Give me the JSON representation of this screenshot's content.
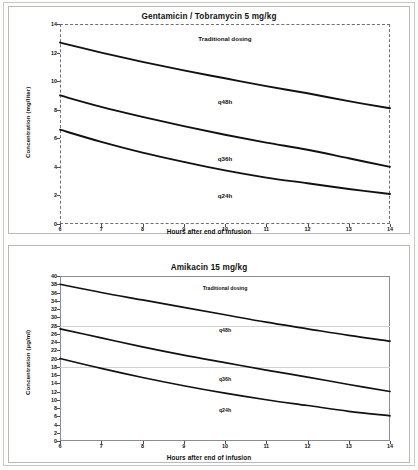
{
  "chart_data": [
    {
      "type": "line",
      "title": "Gentamicin / Tobramycin   5 mg/kg",
      "xlabel": "Hours after end of infusion",
      "ylabel": "Concentration (mg/liter)",
      "xlim": [
        6,
        14
      ],
      "ylim": [
        0,
        14
      ],
      "xticks": [
        6,
        7,
        8,
        9,
        10,
        11,
        12,
        13,
        14
      ],
      "yticks": [
        0,
        2,
        4,
        6,
        8,
        10,
        12,
        14
      ],
      "grid": false,
      "legend": "none",
      "x": [
        6,
        7,
        8,
        9,
        10,
        11,
        12,
        13,
        14
      ],
      "series": [
        {
          "name": "q48h",
          "values": [
            12.7,
            12.0,
            11.35,
            10.75,
            10.2,
            9.65,
            9.15,
            8.6,
            8.1
          ]
        },
        {
          "name": "q36h",
          "values": [
            9.0,
            8.2,
            7.5,
            6.85,
            6.25,
            5.7,
            5.2,
            4.6,
            4.0
          ]
        },
        {
          "name": "q24h",
          "values": [
            6.6,
            5.75,
            5.0,
            4.35,
            3.75,
            3.25,
            2.85,
            2.45,
            2.1
          ]
        }
      ],
      "annotations": [
        {
          "text": "Traditional dosing",
          "x": 10.0,
          "y": 13.0
        },
        {
          "text": "q48h",
          "x": 10.0,
          "y": 8.6
        },
        {
          "text": "q36h",
          "x": 10.0,
          "y": 4.6
        },
        {
          "text": "q24h",
          "x": 10.0,
          "y": 2.0
        }
      ]
    },
    {
      "type": "line",
      "title": "Amikacin   15 mg/kg",
      "xlabel": "Hours after end of infusion",
      "ylabel": "Concentration (µg/ml)",
      "xlim": [
        6,
        14
      ],
      "ylim": [
        0,
        40
      ],
      "xticks": [
        6,
        7,
        8,
        9,
        10,
        11,
        12,
        13,
        14
      ],
      "yticks": [
        0,
        2,
        4,
        6,
        8,
        10,
        12,
        14,
        16,
        18,
        20,
        22,
        24,
        26,
        28,
        30,
        32,
        34,
        36,
        38,
        40
      ],
      "grid": false,
      "gridlines_y": [
        28,
        18
      ],
      "legend": "none",
      "x": [
        6,
        7,
        8,
        9,
        10,
        11,
        12,
        13,
        14
      ],
      "series": [
        {
          "name": "q48h",
          "values": [
            38.0,
            36.0,
            34.2,
            32.4,
            30.6,
            28.8,
            27.2,
            25.6,
            24.2
          ]
        },
        {
          "name": "q36h",
          "values": [
            27.2,
            25.0,
            22.8,
            20.8,
            19.0,
            17.2,
            15.5,
            13.7,
            12.0
          ]
        },
        {
          "name": "q24h",
          "values": [
            20.0,
            17.6,
            15.4,
            13.4,
            11.6,
            10.0,
            8.6,
            7.2,
            6.1
          ]
        }
      ],
      "annotations": [
        {
          "text": "Traditional dosing",
          "x": 10.0,
          "y": 37.0
        },
        {
          "text": "q48h",
          "x": 10.0,
          "y": 27.0
        },
        {
          "text": "q36h",
          "x": 10.0,
          "y": 15.0
        },
        {
          "text": "q24h",
          "x": 10.0,
          "y": 7.5
        }
      ]
    }
  ],
  "top": {
    "title": "Gentamicin / Tobramycin   5 mg/kg",
    "ylabel": "Concentration (mg/liter)",
    "xlabel": "Hours after end of infusion",
    "annotations": {
      "traditional": "Traditional dosing",
      "q48h": "q48h",
      "q36h": "q36h",
      "q24h": "q24h"
    }
  },
  "bottom": {
    "title": "Amikacin   15 mg/kg",
    "ylabel": "Concentration (µg/ml)",
    "xlabel": "Hours after end of infusion",
    "annotations": {
      "traditional": "Traditional dosing",
      "q48h": "q48h",
      "q36h": "q36h",
      "q24h": "q24h"
    }
  },
  "colors": {
    "curve": "#111111",
    "axis": "#6f6f6f",
    "gridline": "#d2d2d2",
    "page": "#fefefe"
  }
}
